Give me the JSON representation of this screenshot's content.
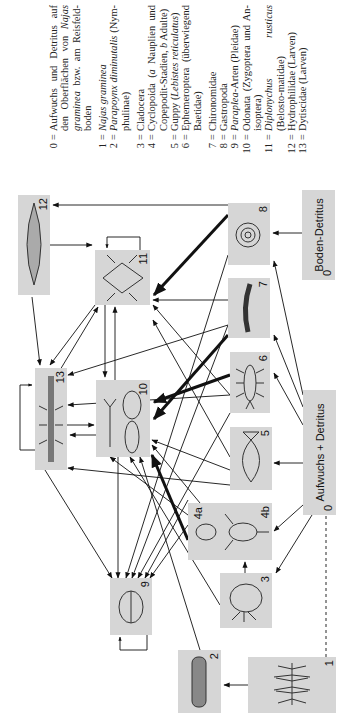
{
  "diagram": {
    "type": "food-web",
    "orientation": "rotated-90-ccw",
    "nodes": [
      {
        "id": "0a",
        "label": "Aufwuchs + Detritus",
        "number": "0"
      },
      {
        "id": "0b",
        "label": "Boden-Detritus",
        "number": "0"
      },
      {
        "id": "1",
        "number": "1",
        "depicts": "Najas graminea (plant)"
      },
      {
        "id": "2",
        "number": "2",
        "depicts": "Parapoynx larva"
      },
      {
        "id": "3",
        "number": "3",
        "depicts": "Cladocera"
      },
      {
        "id": "4",
        "numbers": [
          "4a",
          "4b"
        ],
        "depicts": "Cyclopoida nauplius / adult"
      },
      {
        "id": "5",
        "number": "5",
        "depicts": "Guppy"
      },
      {
        "id": "6",
        "number": "6",
        "depicts": "Ephemeroptera larva"
      },
      {
        "id": "7",
        "number": "7",
        "depicts": "Chironomid larva"
      },
      {
        "id": "8",
        "number": "8",
        "depicts": "Gastropod shell"
      },
      {
        "id": "9",
        "number": "9",
        "depicts": "Paraplea"
      },
      {
        "id": "10",
        "number": "10",
        "depicts": "Odonata larvae"
      },
      {
        "id": "11",
        "number": "11",
        "depicts": "Diplonychus rusticus"
      },
      {
        "id": "12",
        "number": "12",
        "depicts": "Hydrophilidae larva"
      },
      {
        "id": "13",
        "number": "13",
        "depicts": "Dytiscidae larva"
      }
    ]
  },
  "legend": [
    {
      "k": "0",
      "parts": [
        {
          "t": "Aufwuchs und Detritus auf den Oberflächen von "
        },
        {
          "t": "Najas graminea",
          "i": true
        },
        {
          "t": " bzw. am Reisfeld-boden"
        }
      ]
    },
    {
      "k": "1",
      "parts": [
        {
          "t": "Najas graminea",
          "i": true
        }
      ]
    },
    {
      "k": "2",
      "parts": [
        {
          "t": "Parapoynx diminutalis",
          "i": true
        },
        {
          "t": " (Nym-phulinae)"
        }
      ]
    },
    {
      "k": "3",
      "parts": [
        {
          "t": "Cladocera"
        }
      ]
    },
    {
      "k": "4",
      "parts": [
        {
          "t": "Cyclopoida ("
        },
        {
          "t": "a",
          "i": true
        },
        {
          "t": " Nauplien und Copepodit-Stadien, "
        },
        {
          "t": "b",
          "i": true
        },
        {
          "t": " Adulte)"
        }
      ]
    },
    {
      "k": "5",
      "parts": [
        {
          "t": "Guppy ("
        },
        {
          "t": "Lebistes reticulatus",
          "i": true
        },
        {
          "t": ")"
        }
      ]
    },
    {
      "k": "6",
      "parts": [
        {
          "t": "Ephemeroptera (überwiegend Baetidae)"
        }
      ]
    },
    {
      "k": "7",
      "parts": [
        {
          "t": "Chironomidae"
        }
      ]
    },
    {
      "k": "8",
      "parts": [
        {
          "t": "Gastropoda"
        }
      ]
    },
    {
      "k": "9",
      "parts": [
        {
          "t": "Paraplea",
          "i": true
        },
        {
          "t": "-Arten (Pleidae)"
        }
      ]
    },
    {
      "k": "10",
      "parts": [
        {
          "t": "Odonata (Zygoptera und An-isoptera)"
        }
      ]
    },
    {
      "k": "11",
      "parts": [
        {
          "t": "Diplonychus rusticus",
          "i": true
        },
        {
          "t": " (Belosto-matidae)"
        }
      ]
    },
    {
      "k": "12",
      "parts": [
        {
          "t": "Hydrophilidae (Larven)"
        }
      ]
    },
    {
      "k": "13",
      "parts": [
        {
          "t": "Dytiscidae (Larven)"
        }
      ]
    }
  ],
  "labels": {
    "aufwuchs": "Aufwuchs + Detritus",
    "boden": "Boden-Detritus",
    "zero": "0",
    "n1": "1",
    "n2": "2",
    "n3": "3",
    "n4a": "4a",
    "n4b": "4b",
    "n5": "5",
    "n6": "6",
    "n7": "7",
    "n8": "8",
    "n9": "9",
    "n10": "10",
    "n11": "11",
    "n12": "12",
    "n13": "13"
  },
  "colors": {
    "box": "#d6d6d6",
    "edge": "#111111"
  }
}
